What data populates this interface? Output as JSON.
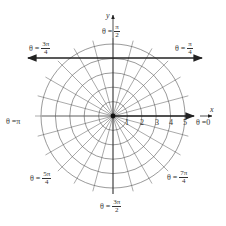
{
  "figure": {
    "type": "polar-coordinate-grid",
    "center_px": [
      113,
      116
    ],
    "ring_step_px": 14.4,
    "ring_count": 5,
    "spoke_step_deg": 15,
    "spoke_length_px": 78,
    "colors": {
      "grid": "#555555",
      "axis": "#222222",
      "text": "#333333"
    }
  },
  "axes": {
    "x_label": "x",
    "y_label": "y",
    "radius_ticks": [
      "1",
      "2",
      "3",
      "4",
      "5"
    ]
  },
  "highlighted_line": {
    "equation": "y = 4",
    "description": "horizontal line with arrows at both ends"
  },
  "angle_labels": {
    "zero": {
      "prefix": "θ = ",
      "value": "0"
    },
    "pi_4": {
      "prefix": "θ = ",
      "num": "π",
      "den": "4"
    },
    "pi_2": {
      "prefix": "θ = ",
      "num": "π",
      "den": "2"
    },
    "3pi_4": {
      "prefix": "θ = ",
      "num": "3π",
      "den": "4"
    },
    "pi": {
      "prefix": "θ = ",
      "value": "π"
    },
    "5pi_4": {
      "prefix": "θ = ",
      "num": "5π",
      "den": "4"
    },
    "3pi_2": {
      "prefix": "θ = ",
      "num": "3π",
      "den": "2"
    },
    "7pi_4": {
      "prefix": "θ = ",
      "num": "7π",
      "den": "4"
    }
  }
}
